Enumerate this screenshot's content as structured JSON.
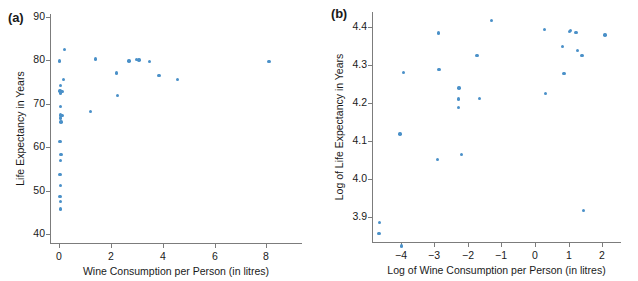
{
  "figure": {
    "panels": [
      {
        "tag": "(a)",
        "xlabel": "Wine Consumption per Person (in litres)",
        "ylabel": "Life Expectancy in Years",
        "xticks": [
          "0",
          "2",
          "4",
          "6",
          "8"
        ],
        "yticks": [
          "90",
          "80",
          "70",
          "60",
          "50",
          "40"
        ]
      },
      {
        "tag": "(b)",
        "xlabel": "Log of Wine Consumption per Person (in litres)",
        "ylabel": "Log of Life Expectancy in Years",
        "xticks": [
          "−4",
          "−3",
          "−2",
          "−1",
          "0",
          "1",
          "2"
        ],
        "yticks": [
          "4.4",
          "4.3",
          "4.2",
          "4.1",
          "4.0",
          "3.9"
        ]
      }
    ],
    "marker_color": "#4a90c8",
    "axis_color": "#7c7c7c"
  },
  "chart_data": [
    {
      "type": "scatter",
      "title": "(a)",
      "xlabel": "Wine Consumption per Person (in litres)",
      "ylabel": "Life Expectancy in Years",
      "xlim": [
        -0.35,
        9.3
      ],
      "ylim": [
        38.0,
        90.7
      ],
      "xticks": [
        0,
        2,
        4,
        6,
        8
      ],
      "yticks": [
        40,
        50,
        60,
        70,
        80,
        90
      ],
      "grid": false,
      "legend": null,
      "points": [
        {
          "x": 0.22,
          "y": 82.5
        },
        {
          "x": 0.02,
          "y": 79.9
        },
        {
          "x": 0.18,
          "y": 75.6
        },
        {
          "x": 0.05,
          "y": 74.2
        },
        {
          "x": 0.04,
          "y": 73.0
        },
        {
          "x": 0.1,
          "y": 72.9
        },
        {
          "x": 0.13,
          "y": 72.8
        },
        {
          "x": 0.06,
          "y": 72.5
        },
        {
          "x": 0.05,
          "y": 69.4
        },
        {
          "x": 0.06,
          "y": 67.5
        },
        {
          "x": 0.12,
          "y": 67.3
        },
        {
          "x": 0.05,
          "y": 66.8
        },
        {
          "x": 0.07,
          "y": 65.8
        },
        {
          "x": 0.04,
          "y": 61.4
        },
        {
          "x": 0.08,
          "y": 58.4
        },
        {
          "x": 0.06,
          "y": 57.0
        },
        {
          "x": 0.04,
          "y": 53.8
        },
        {
          "x": 0.05,
          "y": 51.3
        },
        {
          "x": 0.04,
          "y": 48.7
        },
        {
          "x": 0.06,
          "y": 47.5
        },
        {
          "x": 0.05,
          "y": 45.8
        },
        {
          "x": 1.4,
          "y": 80.3
        },
        {
          "x": 1.22,
          "y": 68.3
        },
        {
          "x": 2.22,
          "y": 77.1
        },
        {
          "x": 2.25,
          "y": 72.0
        },
        {
          "x": 2.7,
          "y": 79.9
        },
        {
          "x": 2.98,
          "y": 80.2
        },
        {
          "x": 3.08,
          "y": 80.1
        },
        {
          "x": 3.5,
          "y": 79.8
        },
        {
          "x": 3.86,
          "y": 76.6
        },
        {
          "x": 4.58,
          "y": 75.6
        },
        {
          "x": 8.1,
          "y": 79.7
        }
      ]
    },
    {
      "type": "scatter",
      "title": "(b)",
      "xlabel": "Log of Wine Consumption per Person (in litres)",
      "ylabel": "Log of Life Expectancy in Years",
      "xlim": [
        -4.85,
        2.5
      ],
      "ylim": [
        3.835,
        4.44
      ],
      "xticks": [
        -4,
        -3,
        -2,
        -1,
        0,
        1,
        2
      ],
      "yticks": [
        3.9,
        4.0,
        4.1,
        4.2,
        4.3,
        4.4
      ],
      "grid": false,
      "legend": null,
      "points": [
        {
          "x": -4.62,
          "y": 3.886
        },
        {
          "x": -4.64,
          "y": 3.858
        },
        {
          "x": -3.98,
          "y": 3.824
        },
        {
          "x": -4.02,
          "y": 4.119
        },
        {
          "x": -3.92,
          "y": 4.281
        },
        {
          "x": -2.88,
          "y": 4.385
        },
        {
          "x": -2.86,
          "y": 4.289
        },
        {
          "x": -2.9,
          "y": 4.052
        },
        {
          "x": -2.26,
          "y": 4.24
        },
        {
          "x": -2.27,
          "y": 4.211
        },
        {
          "x": -2.28,
          "y": 4.189
        },
        {
          "x": -2.18,
          "y": 4.065
        },
        {
          "x": -1.72,
          "y": 4.325
        },
        {
          "x": -1.66,
          "y": 4.212
        },
        {
          "x": -1.3,
          "y": 4.418
        },
        {
          "x": 0.28,
          "y": 4.394
        },
        {
          "x": 0.32,
          "y": 4.226
        },
        {
          "x": 0.82,
          "y": 4.349
        },
        {
          "x": 0.86,
          "y": 4.278
        },
        {
          "x": 1.02,
          "y": 4.388
        },
        {
          "x": 1.06,
          "y": 4.391
        },
        {
          "x": 1.22,
          "y": 4.386
        },
        {
          "x": 1.26,
          "y": 4.338
        },
        {
          "x": 1.4,
          "y": 4.325
        },
        {
          "x": 1.44,
          "y": 3.918
        },
        {
          "x": 2.08,
          "y": 4.38
        }
      ]
    }
  ]
}
